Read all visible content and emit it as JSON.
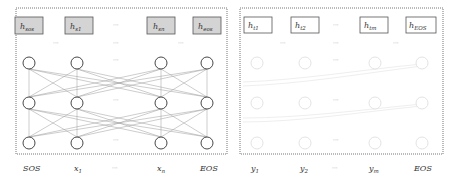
{
  "encoder": {
    "hidden_boxes": [
      {
        "base": "h",
        "sub": "sos"
      },
      {
        "base": "h",
        "sub": "s1"
      },
      {
        "base": "h",
        "sub": "sn"
      },
      {
        "base": "h",
        "sub": "eos"
      }
    ],
    "ellipsis": "···",
    "inputs": [
      "SOS",
      "x",
      "···",
      "x",
      "EOS"
    ],
    "input_subs": [
      "",
      "1",
      "",
      "n",
      ""
    ],
    "box_fill": "#d4d4d4",
    "box_stroke": "#555555"
  },
  "decoder": {
    "hidden_boxes": [
      {
        "base": "h",
        "sub": "t1"
      },
      {
        "base": "h",
        "sub": "t2"
      },
      {
        "base": "h",
        "sub": "tm"
      },
      {
        "base": "h",
        "sub": "EOS"
      }
    ],
    "ellipsis": "···",
    "outputs": [
      "y",
      "y",
      "···",
      "y",
      "EOS"
    ],
    "output_subs": [
      "1",
      "2",
      "",
      "m",
      ""
    ],
    "box_fill": "#ffffff",
    "box_stroke": "#555555"
  }
}
